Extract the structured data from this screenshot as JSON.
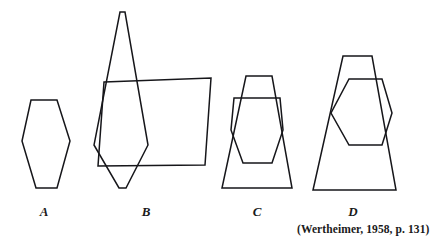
{
  "page": {
    "background_color": "#ffffff",
    "stroke_color": "#16161a",
    "width": 423,
    "height": 244
  },
  "figures": [
    {
      "id": "A",
      "label": "A",
      "description": "single hexagon, tall narrow, flat top and bottom",
      "shapes": [
        {
          "name": "hexagon-a",
          "type": "hexagon",
          "points": "31,100 57,100 70,141 57,188 36,188 22,141"
        }
      ]
    },
    {
      "id": "B",
      "label": "B",
      "description": "elongated hexagon overlapping a parallelogram; hexagon is hidden by the embedding context",
      "shapes": [
        {
          "name": "hexagon-b",
          "type": "hexagon",
          "points": "120,12 125,12 148,145 126,188 119,188 94,145"
        },
        {
          "name": "parallelogram-b",
          "type": "parallelogram",
          "points": "104,82 211,78 205,165 98,166"
        }
      ]
    },
    {
      "id": "C",
      "label": "C",
      "description": "hexagon overlapping a trapezoid of similar width, hexagon stays visible",
      "shapes": [
        {
          "name": "hexagon-c",
          "type": "hexagon",
          "points": "234,98 280,98 283,130 272,163 243,163 231,130"
        },
        {
          "name": "trapezoid-c",
          "type": "trapezoid",
          "points": "246,76 272,76 292,188 222,188"
        }
      ]
    },
    {
      "id": "D",
      "label": "D",
      "description": "wide hexagon overlapping a tall trapezoid, hexagon protrudes to the right",
      "shapes": [
        {
          "name": "hexagon-d",
          "type": "hexagon",
          "points": "349,79 382,79 392,113 382,145 349,145 331,113"
        },
        {
          "name": "trapezoid-d",
          "type": "trapezoid",
          "points": "343,56 372,56 396,190 313,190"
        }
      ]
    }
  ],
  "caption": {
    "source": "(Wertheimer, 1958, p. 131)"
  }
}
